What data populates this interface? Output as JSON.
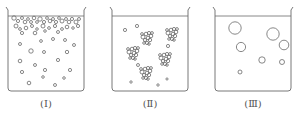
{
  "figure": {
    "stroke_color": "#6a6a6a",
    "beakers": [
      {
        "id": "I",
        "label": "(Ⅰ)",
        "description": "many small bubbles crowded near surface, scattered small bubbles below",
        "x": 8,
        "width": 76,
        "top_bubbles": [
          [
            14,
            18,
            2.2
          ],
          [
            18,
            21,
            1.6
          ],
          [
            22,
            18,
            1.5
          ],
          [
            25,
            22,
            1.8
          ],
          [
            28,
            19,
            1.4
          ],
          [
            31,
            22,
            1.5
          ],
          [
            34,
            18,
            1.8
          ],
          [
            37,
            22,
            1.4
          ],
          [
            40,
            19,
            2.2
          ],
          [
            44,
            22,
            1.6
          ],
          [
            47,
            18,
            1.4
          ],
          [
            50,
            21,
            1.8
          ],
          [
            53,
            19,
            1.5
          ],
          [
            56,
            22,
            1.6
          ],
          [
            59,
            18,
            1.4
          ],
          [
            62,
            21,
            2.0
          ],
          [
            66,
            19,
            1.5
          ],
          [
            69,
            22,
            1.8
          ],
          [
            72,
            19,
            1.6
          ],
          [
            76,
            22,
            2.0
          ],
          [
            79,
            19,
            1.5
          ],
          [
            16,
            26,
            2.0
          ],
          [
            20,
            29,
            1.4
          ],
          [
            26,
            28,
            1.8
          ],
          [
            32,
            26,
            1.5
          ],
          [
            37,
            29,
            1.3
          ],
          [
            43,
            26,
            2.0
          ],
          [
            49,
            28,
            1.4
          ],
          [
            55,
            26,
            1.6
          ],
          [
            62,
            29,
            1.4
          ],
          [
            67,
            27,
            1.8
          ],
          [
            73,
            28,
            1.3
          ],
          [
            78,
            26,
            1.6
          ],
          [
            45,
            31,
            1.3
          ],
          [
            58,
            32,
            1.5
          ],
          [
            22,
            33,
            1.6
          ],
          [
            35,
            33,
            1.8
          ]
        ],
        "scattered_bubbles": [
          [
            20,
            44,
            1.5
          ],
          [
            41,
            41,
            1.4
          ],
          [
            53,
            39,
            1.5
          ],
          [
            65,
            40,
            1.5
          ],
          [
            74,
            45,
            1.5
          ],
          [
            31,
            51,
            2.2
          ],
          [
            44,
            52,
            1.5
          ],
          [
            67,
            52,
            1.7
          ],
          [
            20,
            61,
            1.8
          ],
          [
            58,
            60,
            1.6
          ],
          [
            35,
            65,
            1.5
          ],
          [
            45,
            70,
            1.6
          ],
          [
            70,
            70,
            1.6
          ],
          [
            22,
            72,
            1.6
          ],
          [
            43,
            77,
            1.3
          ],
          [
            64,
            78,
            1.3
          ],
          [
            29,
            83,
            1.8
          ],
          [
            55,
            85,
            1.5
          ]
        ]
      },
      {
        "id": "II",
        "label": "(Ⅱ)",
        "description": "bubbles clustered into groups, few isolated bubbles",
        "x": 112,
        "width": 76,
        "clusters": [
          [
            147,
            37
          ],
          [
            172,
            33
          ],
          [
            133,
            52
          ],
          [
            165,
            58
          ],
          [
            146,
            72
          ]
        ],
        "scattered_bubbles": [
          [
            125,
            30,
            1.6
          ],
          [
            137,
            26,
            1.6
          ],
          [
            168,
            46,
            1.6
          ],
          [
            138,
            65,
            1.5
          ],
          [
            131,
            82,
            1.2
          ],
          [
            158,
            85,
            1.2
          ],
          [
            167,
            79,
            1.1
          ]
        ]
      },
      {
        "id": "III",
        "label": "(Ⅲ)",
        "description": "few large bubbles",
        "x": 215,
        "width": 76,
        "scattered_bubbles": [
          [
            235,
            28,
            6.2
          ],
          [
            273,
            34,
            6.2
          ],
          [
            241,
            47,
            4.6
          ],
          [
            284,
            45,
            4.8
          ],
          [
            262,
            60,
            3.2
          ],
          [
            282,
            62,
            2.5
          ],
          [
            240,
            72,
            2.0
          ]
        ]
      }
    ]
  }
}
